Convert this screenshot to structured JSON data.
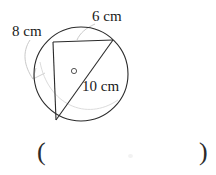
{
  "figure": {
    "type": "circle-with-inscribed-right-triangle",
    "center_marker": "o",
    "labels": {
      "side_left": "8 cm",
      "side_top": "6 cm",
      "diameter": "10 cm"
    },
    "colors": {
      "stroke": "#2b2b2b",
      "leader": "#b9b9b9",
      "background": "#ffffff"
    },
    "circle": {
      "cx": 81,
      "cy": 74,
      "r": 47
    },
    "vertices": {
      "top_left": {
        "x": 53,
        "y": 42
      },
      "top_right": {
        "x": 113,
        "y": 40
      },
      "bottom_left": {
        "x": 56,
        "y": 120
      }
    }
  },
  "answer": {
    "paren_open": "(",
    "paren_close": ")",
    "value": ""
  }
}
